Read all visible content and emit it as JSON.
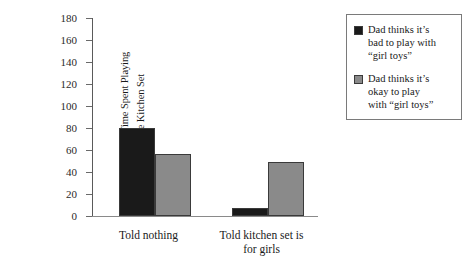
{
  "chart_data": {
    "type": "bar",
    "title": "",
    "subtitle": "",
    "xlabel": "",
    "ylabel_lines": [
      "Amount of Time Spent Playing",
      "with the Kitchen Set"
    ],
    "ylabel": "Amount of Time Spent Playing with the Kitchen Set",
    "categories": [
      "Told nothing",
      "Told kitchen set is for girls"
    ],
    "category_label_lines": [
      [
        "Told nothing"
      ],
      [
        "Told kitchen set is",
        "for girls"
      ]
    ],
    "series": [
      {
        "name": "Dad thinks it’s bad to play with “girl toys”",
        "name_lines": [
          "Dad thinks it’s",
          "bad to play with",
          "“girl toys”"
        ],
        "color": "#1a1a1a",
        "values": [
          80,
          7
        ]
      },
      {
        "name": "Dad thinks it’s okay to play with “girl toys”",
        "name_lines": [
          "Dad thinks it’s",
          "okay to play",
          "with “girl toys”"
        ],
        "color": "#8a8a8a",
        "values": [
          56,
          49
        ]
      }
    ],
    "ylim": [
      0,
      180
    ],
    "ytick_step": 20,
    "yticks": [
      0,
      20,
      40,
      60,
      80,
      100,
      120,
      140,
      160,
      180
    ],
    "ytick_labels": [
      "0",
      "20",
      "40",
      "60",
      "80",
      "100",
      "120",
      "140",
      "160",
      "180"
    ],
    "grid": false,
    "legend_position": "right",
    "legend_boxed": true,
    "bar_edge_color": "#3a3a3a",
    "axis_color": "#5a5a5a",
    "background": "#ffffff"
  }
}
